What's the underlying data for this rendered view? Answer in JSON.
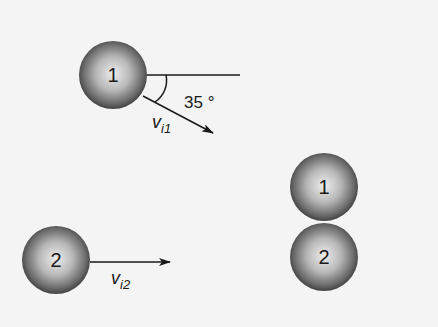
{
  "diagram": {
    "before": {
      "ball1": {
        "label": "1",
        "cx": 113,
        "cy": 75,
        "r": 34
      },
      "ball2": {
        "label": "2",
        "cx": 56,
        "cy": 260,
        "r": 34
      },
      "reference_line": {
        "x1": 147,
        "y1": 75,
        "x2": 240,
        "y2": 75
      },
      "velocity1": {
        "label_main": "v",
        "label_sub": "i1",
        "x1": 143,
        "y1": 96,
        "x2": 213,
        "y2": 133
      },
      "angle": {
        "value": "35 °"
      },
      "velocity2": {
        "label_main": "v",
        "label_sub": "i2",
        "x1": 90,
        "y1": 262,
        "x2": 170,
        "y2": 262
      }
    },
    "after": {
      "ball1": {
        "label": "1",
        "cx": 324,
        "cy": 187,
        "r": 34
      },
      "ball2": {
        "label": "2",
        "cx": 324,
        "cy": 257,
        "r": 34
      }
    },
    "colors": {
      "background": "#f4f4f4",
      "stroke": "#1a1a1a",
      "ball_light": "#e8e8e8",
      "ball_dark": "#3a3a3a"
    }
  }
}
